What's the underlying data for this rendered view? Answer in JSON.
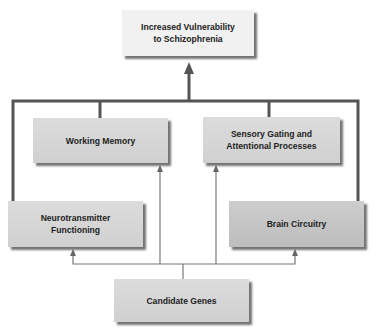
{
  "diagram": {
    "nodes": {
      "outcome": {
        "label": "Increased Vulnerability to Schizophrenia",
        "line1": "Increased Vulnerability",
        "line2": "to Schizophrenia"
      },
      "working_memory": {
        "label": "Working Memory"
      },
      "sensory_gating": {
        "label": "Sensory Gating and Attentional Processes",
        "line1": "Sensory Gating and",
        "line2": "Attentional Processes"
      },
      "neurotransmitter": {
        "label": "Neurotransmitter Functioning",
        "line1": "Neurotransmitter",
        "line2": "Functioning"
      },
      "brain_circuitry": {
        "label": "Brain Circuitry"
      },
      "candidate_genes": {
        "label": "Candidate Genes"
      }
    },
    "edges": [
      {
        "from": "candidate_genes",
        "to": "neurotransmitter"
      },
      {
        "from": "candidate_genes",
        "to": "working_memory"
      },
      {
        "from": "candidate_genes",
        "to": "sensory_gating"
      },
      {
        "from": "candidate_genes",
        "to": "brain_circuitry"
      },
      {
        "from": "neurotransmitter",
        "to": "outcome"
      },
      {
        "from": "working_memory",
        "to": "outcome"
      },
      {
        "from": "sensory_gating",
        "to": "outcome"
      },
      {
        "from": "brain_circuitry",
        "to": "outcome"
      }
    ],
    "colors": {
      "thick_line": "#555555",
      "thin_line": "#777777",
      "box_light": "#f1f1f1",
      "box_mid": "#d6d6d6",
      "box_dark": "#c4c4c4"
    }
  }
}
